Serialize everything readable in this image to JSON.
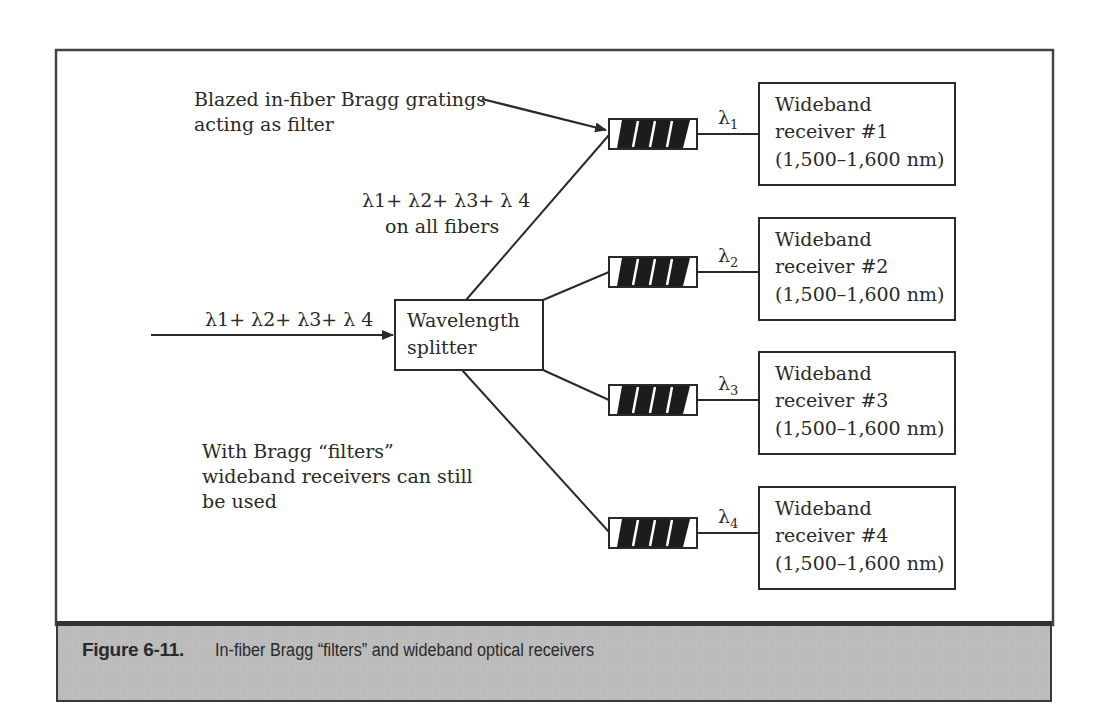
{
  "annotations": {
    "gratings_line1": "Blazed in-fiber Bragg gratings",
    "gratings_line2": "acting as filter",
    "all_fibers_sum": "λ1+ λ2+ λ3+ λ 4",
    "all_fibers_line2": "on all fibers",
    "input_sum": "λ1+ λ2+ λ3+ λ 4",
    "note_line1": "With Bragg “filters”",
    "note_line2": "wideband receivers can still",
    "note_line3": "be used"
  },
  "splitter": {
    "line1": "Wavelength",
    "line2": "splitter"
  },
  "wavelength_symbol": "λ",
  "channels": [
    {
      "sub": "1",
      "receiver_line1": "Wideband",
      "receiver_line2": "receiver #1",
      "receiver_line3": "(1,500–1,600 nm)"
    },
    {
      "sub": "2",
      "receiver_line1": "Wideband",
      "receiver_line2": "receiver #2",
      "receiver_line3": "(1,500–1,600 nm)"
    },
    {
      "sub": "3",
      "receiver_line1": "Wideband",
      "receiver_line2": "receiver #3",
      "receiver_line3": "(1,500–1,600 nm)"
    },
    {
      "sub": "4",
      "receiver_line1": "Wideband",
      "receiver_line2": "receiver #4",
      "receiver_line3": "(1,500–1,600 nm)"
    }
  ],
  "caption": {
    "label": "Figure 6-11.",
    "text": "In-fiber Bragg “filters” and wideband optical receivers"
  },
  "colors": {
    "line": "#2a2a2a",
    "caption_bg": "#bdbdbd",
    "filter_fill": "#1c1c1c"
  }
}
